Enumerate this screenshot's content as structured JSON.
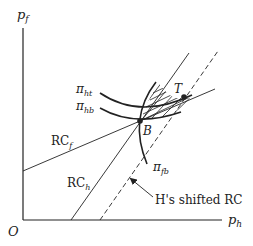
{
  "axes": {
    "y_label": "p",
    "y_sub": "f",
    "x_label": "p",
    "x_sub": "h",
    "origin": "O"
  },
  "curves": {
    "pi_ht": {
      "sym": "π",
      "sub": "ht"
    },
    "pi_hb": {
      "sym": "π",
      "sub": "hb"
    },
    "pi_fb": {
      "sym": "π",
      "sub": "fb"
    }
  },
  "lines": {
    "rc_f": {
      "label": "RC",
      "sub": "f"
    },
    "rc_h": {
      "label": "RC",
      "sub": "h"
    },
    "shifted": {
      "label": "H's shifted RC"
    }
  },
  "points": {
    "B": "B",
    "T": "T"
  },
  "colors": {
    "ink": "#222222",
    "background": "#ffffff"
  }
}
